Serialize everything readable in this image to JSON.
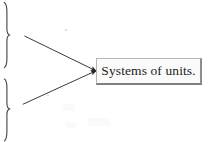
{
  "diagram": {
    "type": "concept-map",
    "background_color": "#ffffff",
    "stroke_color": "#3a3a3a",
    "label_box": {
      "text": "Systems of units.",
      "fill_color": "#fbfbfb",
      "border_color": "#8d8d8d",
      "text_color": "#1b1b1b",
      "x": 96,
      "y": 58,
      "width": 106,
      "height": 27
    },
    "braces": [
      {
        "name": "upper-brace",
        "glyph": "}",
        "orientation": "right-facing",
        "x": 7,
        "y_top": 2,
        "y_bottom": 68
      },
      {
        "name": "lower-brace",
        "glyph": "}",
        "orientation": "right-facing",
        "x": 7,
        "y_top": 79,
        "y_bottom": 141
      }
    ],
    "connectors": [
      {
        "name": "arrow-to-upper-brace",
        "from": {
          "x": 96,
          "y": 71
        },
        "to": {
          "x": 20,
          "y": 34
        },
        "arrowhead": "at-target",
        "target": "upper-brace"
      },
      {
        "name": "arrow-to-lower-brace",
        "from": {
          "x": 96,
          "y": 71
        },
        "to": {
          "x": 18,
          "y": 106
        },
        "arrowhead": "at-target",
        "target": "lower-brace"
      }
    ],
    "artifacts": [
      {
        "name": "scan-speck-upper",
        "x": 65,
        "y": 29
      },
      {
        "name": "scan-speck-lower",
        "x": 47,
        "y": 94
      }
    ]
  }
}
